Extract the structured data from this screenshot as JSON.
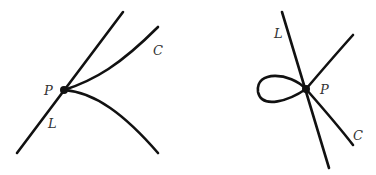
{
  "figures": [
    {
      "id": "left",
      "description": "Line L tangent at cusp point P of curve C",
      "labels": {
        "point": "P",
        "line": "L",
        "curve": "C"
      }
    },
    {
      "id": "right",
      "description": "Line L passing through node (self-intersection) P of curve C with a loop",
      "labels": {
        "point": "P",
        "line": "L",
        "curve": "C"
      }
    }
  ],
  "colors": {
    "stroke": "#111111",
    "label": "#333333"
  }
}
